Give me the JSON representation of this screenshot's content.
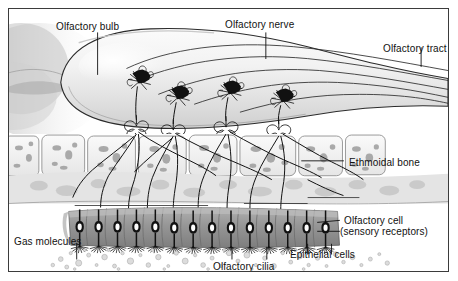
{
  "figure": {
    "background_color": "#ffffff",
    "border_color": "#3b3b3b",
    "ink_color": "#111111"
  },
  "labels": {
    "olfactory_bulb": "Olfactory bulb",
    "olfactory_nerve": "Olfactory nerve",
    "olfactory_tract": "Olfactory tract",
    "ethmoidal_bone": "Ethmoidal bone",
    "olfactory_cell_line1": "Olfactory cell",
    "olfactory_cell_line2": "(sensory receptors)",
    "gas_molecules": "Gas molecules",
    "olfactory_cilia": "Olfactory cilia",
    "epithelial_cells": "Epithelial cells"
  },
  "structures": {
    "bulb": {
      "name": "olfactory-bulb",
      "description": "Large teardrop-shaped grey-white mass occupying the upper half",
      "fill": "#efefef",
      "stroke": "#2b2b2b"
    },
    "mitral_cells": {
      "name": "mitral-cell",
      "count": 4,
      "fill": "#111111",
      "x_positions": [
        131,
        170,
        222,
        275
      ],
      "y_positions": [
        73,
        88,
        83,
        92
      ]
    },
    "glomeruli": {
      "name": "glomerulus",
      "count": 4,
      "x_positions": [
        128,
        165,
        218,
        272
      ]
    },
    "olfactory_tract_fibers": {
      "name": "tract-fiber",
      "count": 4,
      "stroke": "#2b2b2b"
    },
    "ethmoidal_bone": {
      "name": "ethmoidal-bone-cell",
      "count": 8,
      "fill": "#f2f2f2",
      "stroke": "#8a8a8a"
    },
    "lamina_propria": {
      "name": "lamina-propria",
      "fill": "#e2e2e2"
    },
    "epithelium": {
      "name": "olfactory-epithelium",
      "fill": "#9a9a9a",
      "cell_count": 14
    },
    "receptor_cells": {
      "name": "olfactory-receptor-cell",
      "count": 14,
      "nucleus_fill": "#ffffff",
      "body_fill": "#111111"
    },
    "cilia": {
      "name": "olfactory-cilia",
      "count": 12,
      "stroke": "#111111"
    },
    "gas_molecules": {
      "name": "gas-molecule",
      "count": 70,
      "fill": "#d6d6d6",
      "stroke": "#9e9e9e"
    }
  }
}
